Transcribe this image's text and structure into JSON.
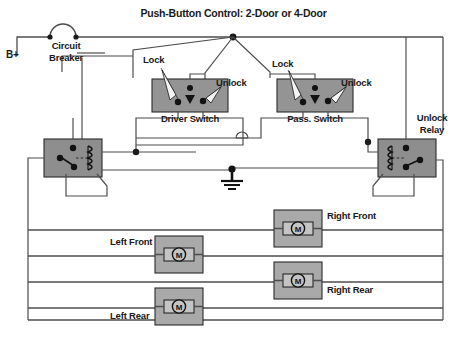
{
  "diagram": {
    "title": "Push-Button Control: 2-Door or 4-Door",
    "power": {
      "supply_label": "B+",
      "breaker_label_line1": "Circuit",
      "breaker_label_line2": "Breaker"
    },
    "switches": [
      {
        "name": "driver-switch",
        "label": "Driver Switch",
        "lock_label": "Lock",
        "unlock_label": "Unlock"
      },
      {
        "name": "passenger-switch",
        "label": "Pass. Switch",
        "lock_label": "Lock",
        "unlock_label": "Unlock"
      }
    ],
    "relays": [
      {
        "name": "lock-relay",
        "label_line1": "",
        "label_line2": ""
      },
      {
        "name": "unlock-relay",
        "label_line1": "Unlock",
        "label_line2": "Relay"
      }
    ],
    "motors": [
      {
        "name": "right-front-motor",
        "label": "Right Front",
        "symbol": "M"
      },
      {
        "name": "left-front-motor",
        "label": "Left Front",
        "symbol": "M"
      },
      {
        "name": "right-rear-motor",
        "label": "Right Rear",
        "symbol": "M"
      },
      {
        "name": "left-rear-motor",
        "label": "Left Rear",
        "symbol": "M"
      }
    ],
    "ground": {
      "name": "chassis-ground",
      "label": ""
    },
    "colors": {
      "wire": "#4d4d4d",
      "ink": "#1a1a1a",
      "switch_fill": "#949494",
      "relay_fill": "#8e8e8e",
      "motor_fill": "#a9a9a9",
      "motor_inner_fill": "#c4c4c4",
      "background": "#ffffff"
    }
  }
}
